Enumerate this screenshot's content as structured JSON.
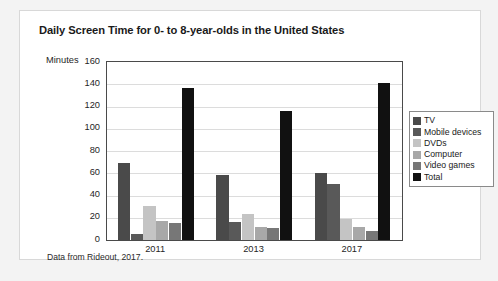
{
  "card": {
    "title": "Daily Screen Time for 0- to 8-year-olds in the United States",
    "source_note": "Data from Rideout, 2017."
  },
  "chart_data": {
    "type": "bar",
    "title": "Daily Screen Time for 0- to 8-year-olds in the United States",
    "xlabel": "",
    "ylabel": "Minutes",
    "ylim": [
      0,
      160
    ],
    "ytick_step": 20,
    "yticks": [
      160,
      140,
      120,
      100,
      80,
      60,
      40,
      20,
      0
    ],
    "grid": true,
    "legend_position": "right",
    "categories": [
      "2011",
      "2013",
      "2017"
    ],
    "series": [
      {
        "name": "TV",
        "color": "#4a4a4a",
        "values": [
          69,
          58,
          60
        ]
      },
      {
        "name": "Mobile devices",
        "color": "#595959",
        "values": [
          5,
          16,
          50
        ]
      },
      {
        "name": "DVDs",
        "color": "#c4c4c4",
        "values": [
          31,
          23,
          19
        ]
      },
      {
        "name": "Computer",
        "color": "#a8a8a8",
        "values": [
          17,
          12,
          12
        ]
      },
      {
        "name": "Video games",
        "color": "#777777",
        "values": [
          15,
          11,
          8
        ]
      },
      {
        "name": "Total",
        "color": "#111111",
        "values": [
          137,
          116,
          141
        ]
      }
    ],
    "annotation": "Data from Rideout, 2017."
  }
}
